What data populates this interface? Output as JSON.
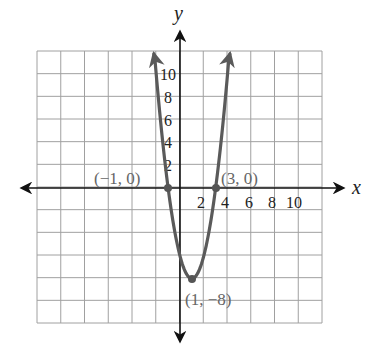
{
  "chart_data": {
    "type": "line",
    "title": "",
    "xlabel": "x",
    "ylabel": "y",
    "xlim": [
      -12,
      12
    ],
    "ylim": [
      -12,
      12
    ],
    "grid": true,
    "grid_step": 2,
    "x_tick_labels": [
      "2",
      "4",
      "6",
      "8",
      "10"
    ],
    "x_tick_values": [
      2,
      4,
      6,
      8,
      10
    ],
    "y_tick_labels": [
      "2",
      "4",
      "6",
      "8",
      "10"
    ],
    "y_tick_values": [
      2,
      4,
      6,
      8,
      10
    ],
    "series": [
      {
        "name": "parabola",
        "kind": "curve",
        "x": [
          -2.2,
          -2,
          -1.5,
          -1,
          -0.5,
          0,
          0.5,
          1,
          1.5,
          2,
          2.5,
          3,
          3.5,
          4,
          4.2
        ],
        "y": [
          12.5,
          10,
          4.5,
          0,
          -3.5,
          -6,
          -7.5,
          -8,
          -7.5,
          -6,
          -3.5,
          0,
          4.5,
          10,
          12.5
        ],
        "color": "#5a5a5a",
        "arrows_at_ends": true
      }
    ],
    "annotations": [
      {
        "label": "(−1, 0)",
        "x": -1,
        "y": 0,
        "marker": true
      },
      {
        "label": "(3, 0)",
        "x": 3,
        "y": 0,
        "marker": true
      },
      {
        "label": "(1, −8)",
        "x": 1,
        "y": -8,
        "marker": true
      }
    ]
  },
  "labels": {
    "x_axis": "x",
    "y_axis": "y",
    "x_ticks": [
      "2",
      "4",
      "6",
      "8",
      "10"
    ],
    "y_ticks": [
      "10",
      "8",
      "6",
      "4",
      "2"
    ],
    "point_left_root": "(−1, 0)",
    "point_right_root": "(3, 0)",
    "point_vertex": "(1, −8)"
  },
  "colors": {
    "curve": "#5a5a5a",
    "grid": "#a0a0a0",
    "axis": "#111111",
    "point_label": "#666666"
  }
}
